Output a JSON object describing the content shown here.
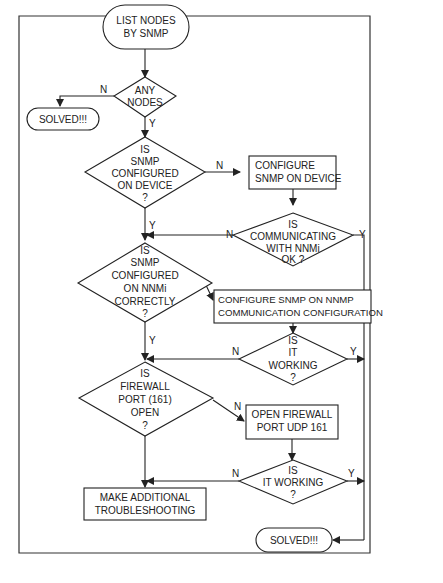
{
  "diagram": {
    "type": "flowchart",
    "nodes": {
      "start": {
        "kind": "terminal",
        "lines": [
          "LIST NODES",
          "BY SNMP"
        ]
      },
      "any_nodes": {
        "kind": "decision",
        "lines": [
          "ANY",
          "NODES",
          "?"
        ]
      },
      "solved_top": {
        "kind": "terminal",
        "lines": [
          "SOLVED!!!"
        ]
      },
      "snmp_on_device": {
        "kind": "decision",
        "lines": [
          "IS",
          "SNMP",
          "CONFIGURED",
          "ON DEVICE",
          "?"
        ]
      },
      "configure_snmp_device": {
        "kind": "process",
        "lines": [
          "CONFIGURE",
          "SNMP ON DEVICE"
        ]
      },
      "communicating": {
        "kind": "decision",
        "lines": [
          "IS",
          "COMMUNICATING",
          "WITH NNMi",
          "OK ?"
        ]
      },
      "snmp_on_nnmi": {
        "kind": "decision",
        "lines": [
          "IS",
          "SNMP",
          "CONFIGURED",
          "ON NNMi",
          "CORRECTLY",
          "?"
        ]
      },
      "configure_snmp_nnmp": {
        "kind": "process",
        "lines": [
          "CONFIGURE SNMP ON NNMP",
          "COMMUNICATION CONFIGURATION"
        ]
      },
      "working1": {
        "kind": "decision",
        "lines": [
          "IS",
          "IT",
          "WORKING",
          "?"
        ]
      },
      "firewall": {
        "kind": "decision",
        "lines": [
          "IS",
          "FIREWALL",
          "PORT (161)",
          "OPEN",
          "?"
        ]
      },
      "open_firewall": {
        "kind": "process",
        "lines": [
          "OPEN FIREWALL",
          "PORT UDP 161"
        ]
      },
      "working2": {
        "kind": "decision",
        "lines": [
          "IS",
          "IT WORKING",
          "?"
        ]
      },
      "additional": {
        "kind": "process",
        "lines": [
          "MAKE ADDITIONAL",
          "TROUBLESHOOTING"
        ]
      },
      "solved_bottom": {
        "kind": "terminal",
        "lines": [
          "SOLVED!!!"
        ]
      }
    },
    "edge_labels": {
      "yes": "Y",
      "no": "N"
    },
    "edges": [
      {
        "from": "start",
        "to": "any_nodes",
        "label": ""
      },
      {
        "from": "any_nodes",
        "to": "solved_top",
        "label": "N"
      },
      {
        "from": "any_nodes",
        "to": "snmp_on_device",
        "label": "Y"
      },
      {
        "from": "snmp_on_device",
        "to": "configure_snmp_device",
        "label": "N"
      },
      {
        "from": "snmp_on_device",
        "to": "snmp_on_nnmi",
        "label": "Y"
      },
      {
        "from": "configure_snmp_device",
        "to": "communicating",
        "label": ""
      },
      {
        "from": "communicating",
        "to": "snmp_on_nnmi",
        "label": "N"
      },
      {
        "from": "communicating",
        "to": "solved_bottom",
        "label": "Y"
      },
      {
        "from": "snmp_on_nnmi",
        "to": "configure_snmp_nnmp",
        "label": "N"
      },
      {
        "from": "snmp_on_nnmi",
        "to": "firewall",
        "label": "Y"
      },
      {
        "from": "configure_snmp_nnmp",
        "to": "working1",
        "label": ""
      },
      {
        "from": "working1",
        "to": "firewall",
        "label": "N"
      },
      {
        "from": "working1",
        "to": "solved_bottom",
        "label": "Y"
      },
      {
        "from": "firewall",
        "to": "open_firewall",
        "label": "N"
      },
      {
        "from": "firewall",
        "to": "additional",
        "label": ""
      },
      {
        "from": "open_firewall",
        "to": "working2",
        "label": ""
      },
      {
        "from": "working2",
        "to": "additional",
        "label": "N"
      },
      {
        "from": "working2",
        "to": "solved_bottom",
        "label": "Y"
      }
    ]
  }
}
